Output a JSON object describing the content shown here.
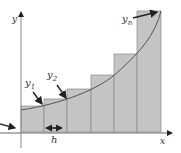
{
  "diagram": {
    "labels": {
      "y_axis": "y",
      "x_axis": "x",
      "y1": "y",
      "y1_sub": "1",
      "y2": "y",
      "y2_sub": "2",
      "yn": "y",
      "yn_sub": "n",
      "width": "h"
    },
    "colors": {
      "rect_fill": "#c4c4c4",
      "rect_stroke": "#8a8a8a",
      "curve": "#555555",
      "axis": "#666666",
      "arrow": "#222222"
    },
    "rectangles": [
      {
        "x": 21,
        "top": 106
      },
      {
        "x": 44,
        "top": 99
      },
      {
        "x": 67,
        "top": 89
      },
      {
        "x": 91,
        "top": 75
      },
      {
        "x": 114,
        "top": 54
      },
      {
        "x": 137,
        "top": 11
      }
    ]
  }
}
